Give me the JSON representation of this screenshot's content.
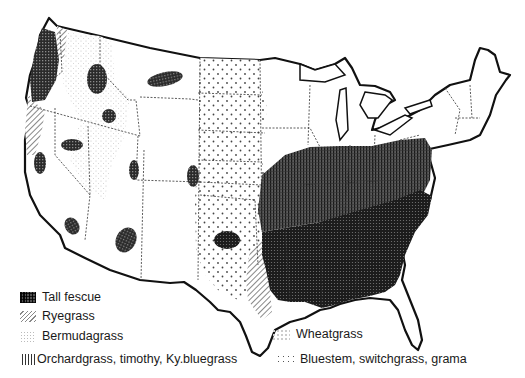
{
  "map": {
    "subject": "Distribution of major grass species in the United States",
    "legend": [
      {
        "key": "tall_fescue",
        "label": "Tall fescue",
        "pattern": "dark cross-hatch"
      },
      {
        "key": "ryegrass",
        "label": "Ryegrass",
        "pattern": "diagonal hatch"
      },
      {
        "key": "bermudagrass",
        "label": "Bermudagrass",
        "pattern": "fine light stipple"
      },
      {
        "key": "orchardgrass",
        "label": "Orchardgrass, timothy, Ky.bluegrass",
        "pattern": "vertical lines"
      },
      {
        "key": "wheatgrass",
        "label": "Wheatgrass",
        "pattern": "light stipple"
      },
      {
        "key": "bluestem",
        "label": "Bluestem, switchgrass, grama",
        "pattern": "sparse dots"
      }
    ],
    "regions": [
      {
        "grass": "tall_fescue",
        "area": "Pacific Northwest coast (western Oregon/Washington)"
      },
      {
        "grass": "tall_fescue",
        "area": "Southeast (Gulf states to Carolinas)"
      },
      {
        "grass": "tall_fescue",
        "area": "scattered western patches (ID, MT, UT, NV, CO, AZ, CA, OK)"
      },
      {
        "grass": "orchardgrass",
        "area": "Mid-Atlantic / Ohio Valley transition zone"
      },
      {
        "grass": "ryegrass",
        "area": "Northern California / southern Oregon coast"
      },
      {
        "grass": "ryegrass",
        "area": "East Texas"
      },
      {
        "grass": "ryegrass",
        "area": "Northern Idaho panhandle"
      },
      {
        "grass": "wheatgrass",
        "area": "Interior Northwest and Great Basin"
      },
      {
        "grass": "bluestem",
        "area": "Great Plains (Dakotas to Texas)"
      }
    ]
  }
}
